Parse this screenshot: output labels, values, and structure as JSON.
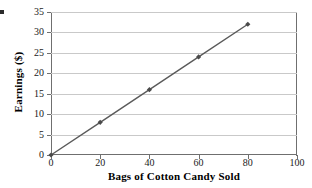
{
  "chart_data": {
    "type": "line",
    "title": "",
    "xlabel": "Bags of Cotton Candy Sold",
    "ylabel": "Earnings ($)",
    "x": [
      0,
      20,
      40,
      60,
      80
    ],
    "values": [
      0,
      8,
      16,
      24,
      32
    ],
    "series": [
      {
        "name": "Earnings",
        "x": [
          0,
          20,
          40,
          60,
          80
        ],
        "values": [
          0,
          8,
          16,
          24,
          32
        ],
        "color": "#5a5a5a",
        "marker": "diamond",
        "marker_color": "#4a4a4a"
      }
    ],
    "xlim": [
      0,
      100
    ],
    "ylim": [
      0,
      35
    ],
    "xticks": [
      0,
      20,
      40,
      60,
      80,
      100
    ],
    "yticks": [
      0,
      5,
      10,
      15,
      20,
      25,
      30,
      35
    ],
    "xtick_labels": [
      "0",
      "20",
      "40",
      "60",
      "80",
      "100"
    ],
    "ytick_labels": [
      "0",
      "5",
      "10",
      "15",
      "20",
      "25",
      "30",
      "35"
    ],
    "grid": "horizontal",
    "grid_color": "#c9c9c9",
    "legend": "none",
    "axis_color": "#6f6f6f",
    "plot_background": "#ffffff"
  }
}
